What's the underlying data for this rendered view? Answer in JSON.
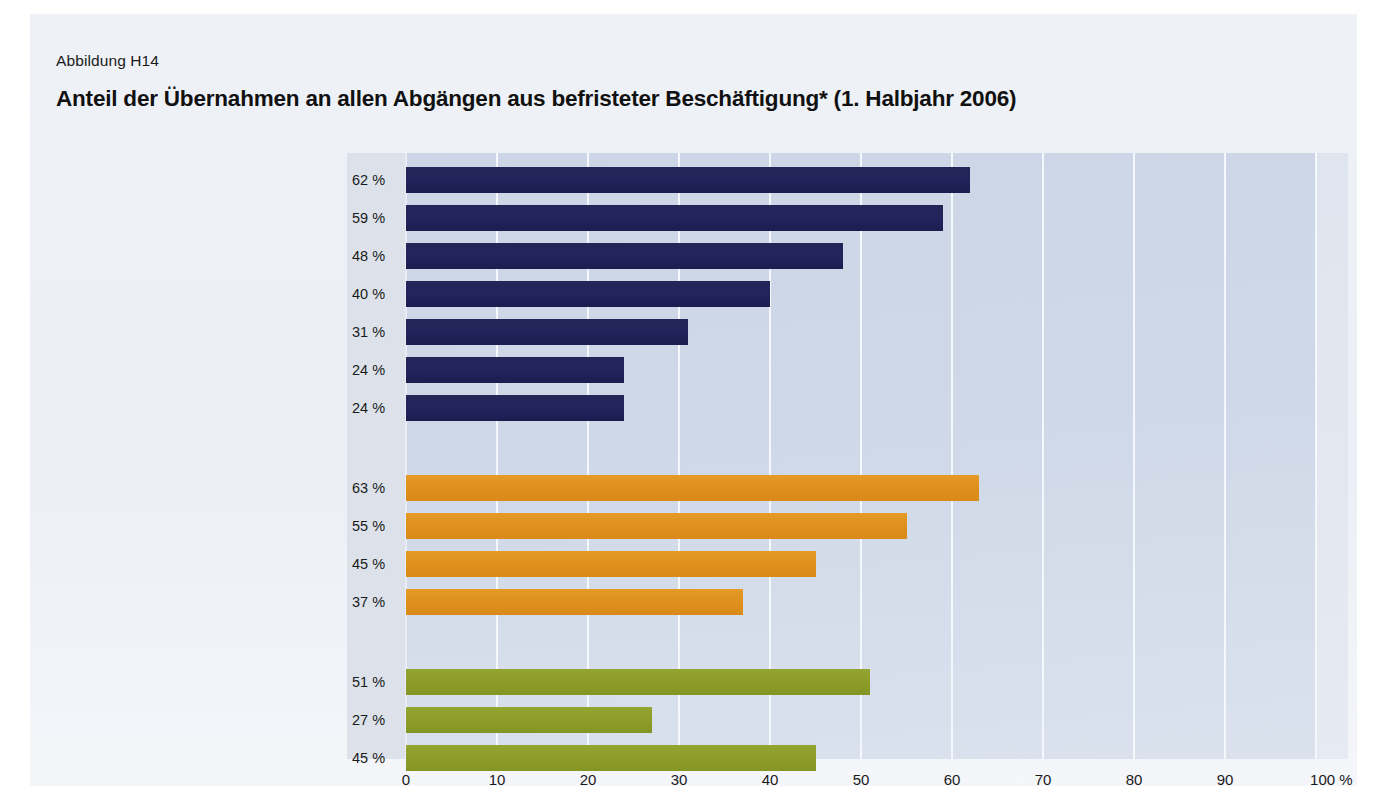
{
  "figure": {
    "number": "Abbildung H14",
    "title": "Anteil der Übernahmen an allen Abgängen aus befristeter Beschäftigung* (1. Halbjahr 2006)"
  },
  "colors": {
    "group1": "#22245c",
    "group2": "#de8f1c",
    "group3": "#8b9c27",
    "plot_background": "#ccd6e6",
    "value_column": "#dde2ea",
    "figure_background": "#eef1f6"
  },
  "chart_data": {
    "type": "bar",
    "orientation": "horizontal",
    "title": "Anteil der Übernahmen an allen Abgängen aus befristeter Beschäftigung* (1. Halbjahr 2006)",
    "xlabel": "%",
    "ylabel": "",
    "xlim": [
      0,
      100
    ],
    "grid": true,
    "legend": "none",
    "xticks": [
      "0",
      "10",
      "20",
      "30",
      "40",
      "50",
      "60",
      "70",
      "80",
      "90",
      "100 %"
    ],
    "xtick_values": [
      0,
      10,
      20,
      30,
      40,
      50,
      60,
      70,
      80,
      90,
      100
    ],
    "groups": [
      {
        "name": "Wirtschaftszweig",
        "color": "#22245c",
        "categories": [
          "Distributive Dienstleistungen",
          "Produzierendes Gewerbe",
          "Produktionsbezogene Dienstleistungen",
          "Personenbezogene Dienstleistungen",
          "Soziale Dienstleistungen",
          "Land- und Forstwirtschaft",
          "Öffentliche Verwaltung"
        ],
        "values": [
          62,
          59,
          48,
          40,
          31,
          24,
          24
        ],
        "value_labels": [
          "62 %",
          "59 %",
          "48 %",
          "40 %",
          "31 %",
          "24 %",
          "24 %"
        ]
      },
      {
        "name": "Betriebsgröße",
        "color": "#de8f1c",
        "categories": [
          "1–10 Beschäftigte",
          "11–49 Beschäftigte",
          "50–249 Beschäftigte",
          "ab 250 Beschäftigte"
        ],
        "values": [
          63,
          55,
          45,
          37
        ],
        "value_labels": [
          "63 %",
          "55 %",
          "45 %",
          "37 %"
        ]
      },
      {
        "name": "Region",
        "color": "#8b9c27",
        "categories": [
          "West",
          "Ost",
          "Insgesamt"
        ],
        "values": [
          51,
          27,
          45
        ],
        "value_labels": [
          "51 %",
          "27 %",
          "45 %"
        ]
      }
    ]
  }
}
